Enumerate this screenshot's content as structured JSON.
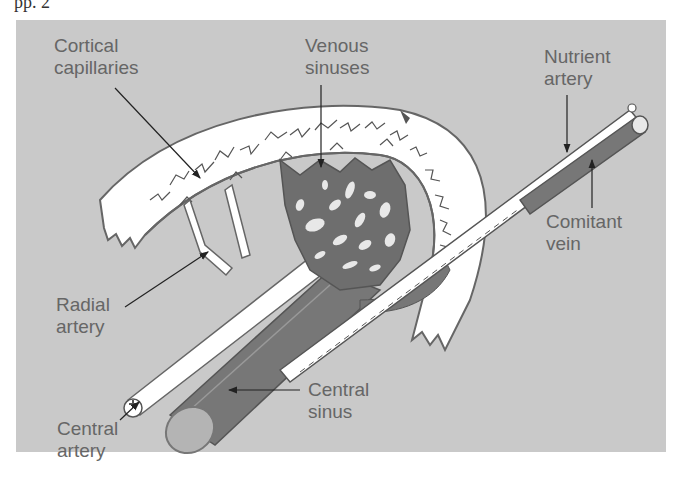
{
  "page": {
    "top_fragment": "pp. 2"
  },
  "figure": {
    "background_color": "#c9c9c9",
    "vessel_dark_color": "#777777",
    "bone_color": "#ffffff",
    "label_color": "#666666",
    "labels": {
      "cortical_capillaries": [
        "Cortical",
        "capillaries"
      ],
      "venous_sinuses": [
        "Venous",
        "sinuses"
      ],
      "nutrient_artery": [
        "Nutrient",
        "artery"
      ],
      "comitant_vein": [
        "Comitant",
        "vein"
      ],
      "radial_artery": [
        "Radial",
        "artery"
      ],
      "central_sinus": [
        "Central",
        "sinus"
      ],
      "central_artery": [
        "Central",
        "artery"
      ]
    }
  }
}
